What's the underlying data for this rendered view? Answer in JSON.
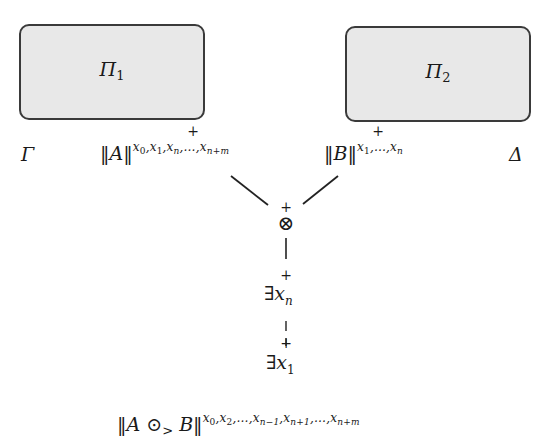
{
  "diagram": {
    "boxes": [
      {
        "id": "pi1",
        "label": "Π",
        "subscript": "1"
      },
      {
        "id": "pi2",
        "label": "Π",
        "subscript": "2"
      }
    ],
    "contexts": {
      "left": "Γ",
      "right": "Δ"
    },
    "premises": {
      "left": {
        "formula": "‖A‖",
        "superscript_parts": [
          "x",
          "0",
          ",x",
          "1",
          ",x",
          "n",
          ",…,x",
          "n+m"
        ],
        "marked_variable": "xₙ",
        "mark": "+"
      },
      "right": {
        "formula": "‖B‖",
        "superscript_parts": [
          "x",
          "1",
          ",…,x",
          "n"
        ],
        "marked_variable": "x₁",
        "mark": "+"
      }
    },
    "tensor_node": {
      "symbol": "⊗",
      "mark": "+"
    },
    "exists_nodes": [
      {
        "quantifier": "∃",
        "variable": "x",
        "subscript": "n",
        "mark": "+"
      },
      {
        "quantifier": "∃",
        "variable": "x",
        "subscript": "1",
        "mark": "+"
      }
    ],
    "conclusion": {
      "left": "‖A",
      "operator": "⊙",
      "operator_subscript": ">",
      "right": "B‖",
      "superscript_parts": [
        "x",
        "0",
        ",x",
        "2",
        ",…,x",
        "n−1",
        ",x",
        "n+1",
        ",…,x",
        "n+m"
      ]
    },
    "colors": {
      "box_fill": "#e8e8e8",
      "box_border": "#3a3a3a",
      "ink": "#1a1a1a"
    }
  }
}
